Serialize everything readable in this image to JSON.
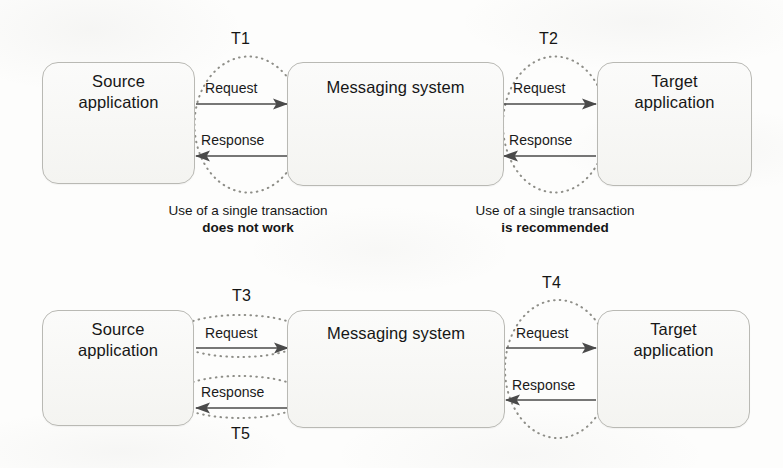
{
  "diagram": {
    "nodes": {
      "source": "Source\napplication",
      "source_line1": "Source",
      "source_line2": "application",
      "messaging": "Messaging system",
      "target_line1": "Target",
      "target_line2": "application"
    },
    "edges": {
      "request": "Request",
      "response": "Response"
    },
    "top_row": {
      "transactions": [
        {
          "id": "T1",
          "label": "T1",
          "shape": "circle",
          "spans": [
            "source",
            "messaging"
          ],
          "covers": [
            "request",
            "response"
          ]
        },
        {
          "id": "T2",
          "label": "T2",
          "shape": "circle",
          "spans": [
            "messaging",
            "target"
          ],
          "covers": [
            "request",
            "response"
          ]
        }
      ],
      "captions": [
        {
          "line1": "Use of a single transaction",
          "line2": "does not work",
          "for": "T1"
        },
        {
          "line1": "Use of a single transaction",
          "line2": "is recommended",
          "for": "T2"
        }
      ]
    },
    "bottom_row": {
      "transactions": [
        {
          "id": "T3",
          "label": "T3",
          "shape": "ellipse",
          "spans": [
            "source",
            "messaging"
          ],
          "covers": [
            "request"
          ]
        },
        {
          "id": "T5",
          "label": "T5",
          "shape": "ellipse",
          "spans": [
            "source",
            "messaging"
          ],
          "covers": [
            "response"
          ]
        },
        {
          "id": "T4",
          "label": "T4",
          "shape": "circle",
          "spans": [
            "messaging",
            "target"
          ],
          "covers": [
            "request",
            "response"
          ]
        }
      ]
    },
    "colors": {
      "box_stroke": "#b9b9b4",
      "box_fill": "#f7f7f5",
      "arrow": "#4a4a4a",
      "dotted_stroke": "#8e8e88",
      "text": "#161616",
      "background": "#fdfdfc"
    }
  }
}
